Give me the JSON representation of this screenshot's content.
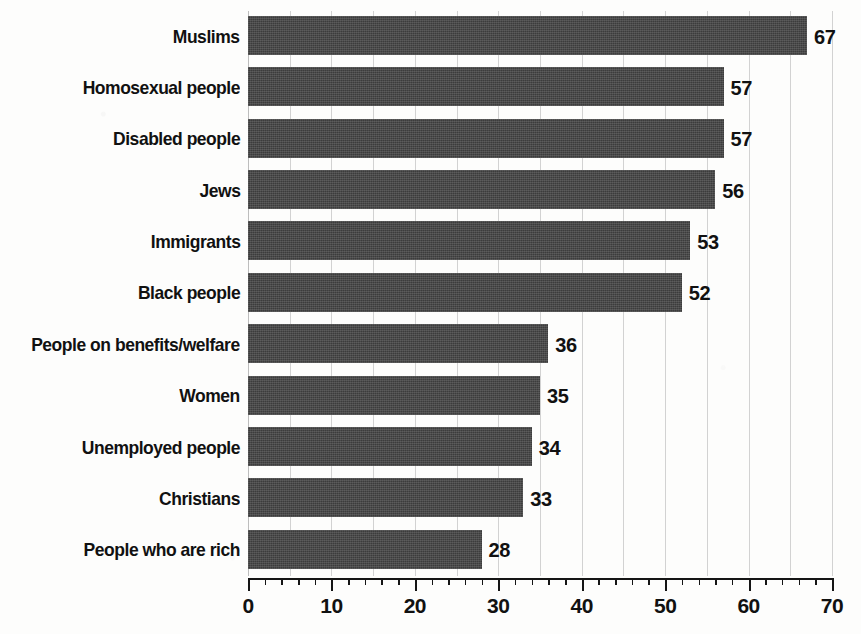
{
  "chart_data": {
    "type": "bar",
    "orientation": "horizontal",
    "title": "",
    "subtitle": "",
    "xlabel": "",
    "ylabel": "",
    "xlim": [
      0,
      70
    ],
    "xticks": [
      0,
      10,
      20,
      30,
      40,
      50,
      60,
      70
    ],
    "xticklabels": [
      "0",
      "10",
      "20",
      "30",
      "40",
      "50",
      "60",
      "70"
    ],
    "minor_tick_step": 2,
    "gridline_step": 5,
    "grid": true,
    "legend": null,
    "categories": [
      "Muslims",
      "Homosexual people",
      "Disabled people",
      "Jews",
      "Immigrants",
      "Black people",
      "People on benefits/welfare",
      "Women",
      "Unemployed people",
      "Christians",
      "People who are rich"
    ],
    "values": [
      67,
      57,
      57,
      56,
      53,
      52,
      36,
      35,
      34,
      33,
      28
    ],
    "value_labels": [
      "67",
      "57",
      "57",
      "56",
      "53",
      "52",
      "36",
      "35",
      "34",
      "33",
      "28"
    ],
    "colors": {
      "bar": "#3c3c3c",
      "grid": "#d2d2d2",
      "axis": "#151515",
      "text": "#111111",
      "background": "#fdfdfc"
    }
  }
}
